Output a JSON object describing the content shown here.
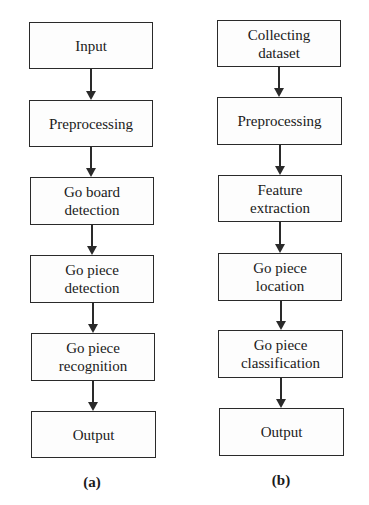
{
  "figure": {
    "panels": [
      {
        "id": "a",
        "caption": "(a)",
        "steps": [
          "Input",
          "Preprocessing",
          "Go board\ndetection",
          "Go piece\ndetection",
          "Go piece\nrecognition",
          "Output"
        ]
      },
      {
        "id": "b",
        "caption": "(b)",
        "steps": [
          "Collecting\ndataset",
          "Preprocessing",
          "Feature\nextraction",
          "Go piece\nlocation",
          "Go piece\nclassification",
          "Output"
        ]
      }
    ]
  }
}
